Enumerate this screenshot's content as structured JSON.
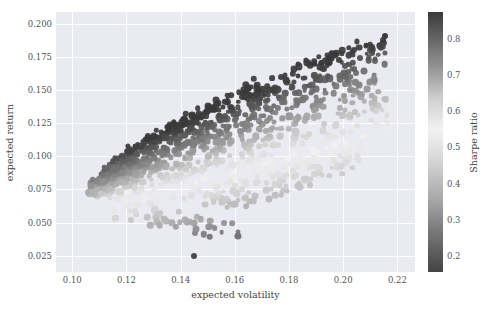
{
  "chart_data": {
    "type": "scatter",
    "title": "",
    "xlabel": "expected volatility",
    "ylabel": "expected return",
    "xlim": [
      0.094,
      0.2265
    ],
    "ylim": [
      0.0128,
      0.2088
    ],
    "xticks": [
      "0.10",
      "0.12",
      "0.14",
      "0.16",
      "0.18",
      "0.20",
      "0.22"
    ],
    "xtick_values": [
      0.1,
      0.12,
      0.14,
      0.16,
      0.18,
      0.2,
      0.22
    ],
    "yticks": [
      "0.025",
      "0.050",
      "0.075",
      "0.100",
      "0.125",
      "0.150",
      "0.175",
      "0.200"
    ],
    "ytick_values": [
      0.025,
      0.05,
      0.075,
      0.1,
      0.125,
      0.15,
      0.175,
      0.2
    ],
    "grid": true,
    "plot_background": "#eaeaf2",
    "grid_color": "#ffffff",
    "marker": "circle",
    "colorbar": {
      "label": "Sharpe ratio",
      "ticks": [
        "0.2",
        "0.3",
        "0.4",
        "0.5",
        "0.6",
        "0.7",
        "0.8"
      ],
      "tick_values": [
        0.2,
        0.3,
        0.4,
        0.5,
        0.6,
        0.7,
        0.8
      ],
      "vmin": 0.155,
      "vmax": 0.875,
      "position": "right",
      "orientation": "vertical",
      "colormap_stops": [
        {
          "pos": 0.0,
          "color": "#444444"
        },
        {
          "pos": 0.12,
          "color": "#6b6b6b"
        },
        {
          "pos": 0.28,
          "color": "#a8a8a8"
        },
        {
          "pos": 0.45,
          "color": "#dcdcdc"
        },
        {
          "pos": 0.55,
          "color": "#f2f2f2"
        },
        {
          "pos": 0.66,
          "color": "#d2d2d2"
        },
        {
          "pos": 0.8,
          "color": "#8e8e8e"
        },
        {
          "pos": 1.0,
          "color": "#3a3a3a"
        }
      ]
    },
    "series": [
      {
        "name": "simulated portfolios",
        "n_points": 1100,
        "x_key": "expected volatility",
        "y_key": "expected return",
        "c_key": "Sharpe ratio"
      }
    ],
    "notable_points": [
      {
        "x": 0.145,
        "y": 0.025,
        "c": 0.17,
        "note": "isolated low-return outlier"
      },
      {
        "x": 0.2155,
        "y": 0.1905,
        "c": 0.885,
        "note": "max-return frontier tip"
      },
      {
        "x": 0.1105,
        "y": 0.0715,
        "c": 0.645,
        "note": "minimum-volatility portfolio"
      },
      {
        "x": 0.2045,
        "y": 0.1335,
        "c": 0.655,
        "note": "rightmost interior point"
      }
    ]
  }
}
